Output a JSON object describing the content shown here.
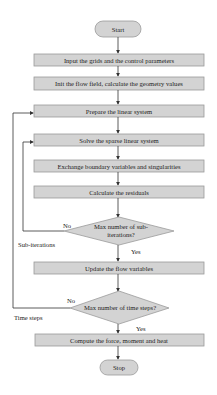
{
  "flowchart": {
    "start": "Start",
    "steps": [
      "Input the grids and the control parameters",
      "Init the flow field, calculate the geometry values",
      "Prepare the linear system",
      "Solve the sparse linear system",
      "Exchange boundary variables and singularities",
      "Calculate the residuals"
    ],
    "decision1": {
      "line1": "Max number of sub-",
      "line2": "iterations?",
      "no": "No",
      "yes": "Yes"
    },
    "update": "Update the flow variables",
    "decision2": {
      "line1": "Max number of time steps?",
      "no": "No",
      "yes": "Yes"
    },
    "compute": "Compute the force, moment and heat",
    "stop": "Stop",
    "loop_labels": {
      "inner": "Sub-iterations",
      "outer": "Time steps"
    }
  },
  "colors": {
    "box_fill": "#d3d3d3",
    "box_stroke": "#9a9a9a",
    "line": "#333333"
  }
}
